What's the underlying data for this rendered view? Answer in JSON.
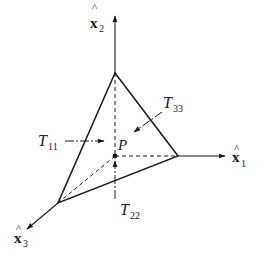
{
  "diagram": {
    "type": "tetrahedron-stress",
    "colors": {
      "ink": "#1a1a1a",
      "background": "#ffffff"
    },
    "axes": [
      {
        "id": "x1",
        "label_base": "x",
        "hat": "^",
        "subscript": "1"
      },
      {
        "id": "x2",
        "label_base": "x",
        "hat": "^",
        "subscript": "2"
      },
      {
        "id": "x3",
        "label_base": "x",
        "hat": "^",
        "subscript": "3"
      }
    ],
    "point": {
      "label": "P"
    },
    "tractions": [
      {
        "id": "T11",
        "label_base": "T",
        "subscript": "11"
      },
      {
        "id": "T22",
        "label_base": "T",
        "subscript": "22"
      },
      {
        "id": "T33",
        "label_base": "T",
        "subscript": "33"
      }
    ]
  }
}
